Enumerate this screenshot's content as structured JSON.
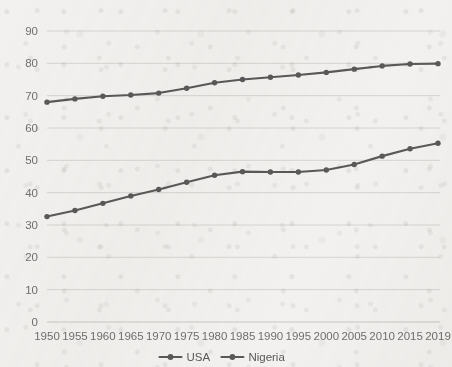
{
  "chart_data": {
    "type": "line",
    "title": "",
    "subtitle": "",
    "xlabel": "",
    "ylabel": "",
    "categories": [
      "1950",
      "1955",
      "1960",
      "1965",
      "1970",
      "1975",
      "1980",
      "1985",
      "1990",
      "1995",
      "2000",
      "2005",
      "2010",
      "2015",
      "2019"
    ],
    "yticks": [
      0,
      10,
      20,
      30,
      40,
      50,
      60,
      70,
      80,
      90
    ],
    "ylim": [
      0,
      90
    ],
    "grid": "horizontal",
    "legend_position": "bottom-center",
    "series": [
      {
        "name": "USA",
        "color": "#595959",
        "marker": "circle",
        "values": [
          68.0,
          69.0,
          69.8,
          70.2,
          70.8,
          72.3,
          74.0,
          75.0,
          75.7,
          76.4,
          77.2,
          78.2,
          79.2,
          79.8,
          79.9
        ]
      },
      {
        "name": "Nigeria",
        "color": "#595959",
        "marker": "circle",
        "values": [
          32.6,
          34.5,
          36.7,
          39.0,
          41.0,
          43.2,
          45.4,
          46.5,
          46.4,
          46.4,
          47.0,
          48.7,
          51.3,
          53.6,
          55.3
        ]
      }
    ]
  },
  "legend": {
    "items": [
      {
        "label": "USA"
      },
      {
        "label": "Nigeria"
      }
    ]
  },
  "colors": {
    "series": "#595959",
    "gridline": "#d6d4d1",
    "tick_text": "#6f6f6f",
    "legend_text": "#585858",
    "background": "#f2f1ef"
  }
}
